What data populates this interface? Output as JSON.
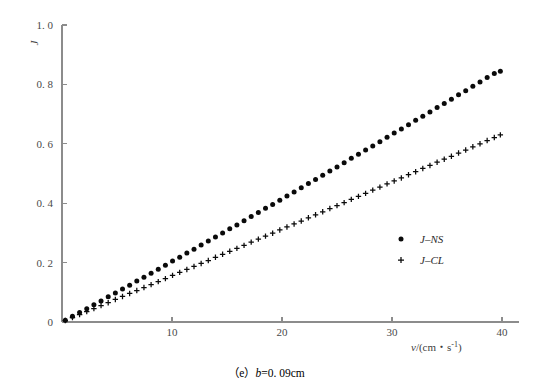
{
  "figure": {
    "caption_prefix": "（e）",
    "caption_var": "b",
    "caption_value": "=0. 09cm",
    "background_color": "#ffffff",
    "axis_color": "#8c8c8c",
    "marker_color": "#0a0a0a"
  },
  "chart_data": {
    "type": "scatter",
    "title": "",
    "xlabel": "v/(cm・s⁻¹)",
    "ylabel": "J",
    "xlabel_italic_part": "v",
    "xlabel_rest": "/(cm・s",
    "xlabel_sup": "-1",
    "xlabel_tail": ")",
    "xlim": [
      0,
      41.5
    ],
    "ylim": [
      0,
      1.0
    ],
    "xticks": [
      10,
      20,
      30,
      40
    ],
    "xtick_labels": [
      "10",
      "20",
      "30",
      "40"
    ],
    "yticks": [
      0,
      0.2,
      0.4,
      0.6,
      0.8,
      1.0
    ],
    "ytick_labels": [
      "0",
      "0. 2",
      "0. 4",
      "0. 6",
      "0. 8",
      "1. 0"
    ],
    "grid": false,
    "legend_position": "center-right",
    "series": [
      {
        "name": "J-NS",
        "marker": "circle",
        "legend_label": "J–NS",
        "x": [
          0.3,
          0.95,
          1.6,
          2.25,
          2.9,
          3.55,
          4.2,
          4.85,
          5.5,
          6.15,
          6.8,
          7.45,
          8.1,
          8.75,
          9.4,
          10.05,
          10.7,
          11.35,
          12.0,
          12.65,
          13.3,
          13.95,
          14.6,
          15.25,
          15.9,
          16.55,
          17.2,
          17.85,
          18.5,
          19.15,
          19.8,
          20.45,
          21.1,
          21.75,
          22.4,
          23.05,
          23.7,
          24.35,
          25.0,
          25.65,
          26.3,
          26.95,
          27.6,
          28.25,
          28.9,
          29.55,
          30.2,
          30.85,
          31.5,
          32.15,
          32.8,
          33.45,
          34.1,
          34.75,
          35.4,
          36.05,
          36.7,
          37.35,
          38.0,
          38.65,
          39.3,
          39.85
        ],
        "y": [
          0.006,
          0.019,
          0.032,
          0.045,
          0.058,
          0.071,
          0.085,
          0.098,
          0.111,
          0.124,
          0.138,
          0.151,
          0.164,
          0.178,
          0.191,
          0.205,
          0.218,
          0.232,
          0.245,
          0.259,
          0.273,
          0.286,
          0.3,
          0.314,
          0.327,
          0.341,
          0.355,
          0.369,
          0.383,
          0.396,
          0.41,
          0.424,
          0.438,
          0.452,
          0.466,
          0.48,
          0.494,
          0.508,
          0.522,
          0.536,
          0.551,
          0.565,
          0.579,
          0.593,
          0.607,
          0.622,
          0.636,
          0.65,
          0.664,
          0.679,
          0.693,
          0.707,
          0.722,
          0.736,
          0.75,
          0.765,
          0.779,
          0.794,
          0.808,
          0.823,
          0.837,
          0.844
        ]
      },
      {
        "name": "J-CL",
        "marker": "plus",
        "legend_label": "J–CL",
        "x": [
          0.3,
          0.95,
          1.6,
          2.25,
          2.9,
          3.55,
          4.2,
          4.85,
          5.5,
          6.15,
          6.8,
          7.45,
          8.1,
          8.75,
          9.4,
          10.05,
          10.7,
          11.35,
          12.0,
          12.65,
          13.3,
          13.95,
          14.6,
          15.25,
          15.9,
          16.55,
          17.2,
          17.85,
          18.5,
          19.15,
          19.8,
          20.45,
          21.1,
          21.75,
          22.4,
          23.05,
          23.7,
          24.35,
          25.0,
          25.65,
          26.3,
          26.95,
          27.6,
          28.25,
          28.9,
          29.55,
          30.2,
          30.85,
          31.5,
          32.15,
          32.8,
          33.45,
          34.1,
          34.75,
          35.4,
          36.05,
          36.7,
          37.35,
          38.0,
          38.65,
          39.3,
          39.85
        ],
        "y": [
          0.005,
          0.015,
          0.025,
          0.035,
          0.045,
          0.055,
          0.065,
          0.076,
          0.086,
          0.096,
          0.106,
          0.116,
          0.126,
          0.136,
          0.146,
          0.157,
          0.167,
          0.177,
          0.187,
          0.197,
          0.207,
          0.218,
          0.228,
          0.238,
          0.248,
          0.258,
          0.269,
          0.279,
          0.289,
          0.299,
          0.31,
          0.32,
          0.33,
          0.34,
          0.351,
          0.361,
          0.371,
          0.382,
          0.392,
          0.402,
          0.413,
          0.423,
          0.433,
          0.444,
          0.454,
          0.465,
          0.475,
          0.485,
          0.496,
          0.506,
          0.517,
          0.527,
          0.538,
          0.548,
          0.558,
          0.569,
          0.579,
          0.59,
          0.6,
          0.611,
          0.621,
          0.63
        ]
      }
    ]
  }
}
